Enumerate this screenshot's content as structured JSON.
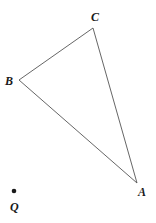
{
  "diagram": {
    "type": "geometry",
    "points": {
      "A": {
        "label": "A",
        "x": 137,
        "y": 183
      },
      "B": {
        "label": "B",
        "x": 19,
        "y": 80
      },
      "C": {
        "label": "C",
        "x": 93,
        "y": 28
      },
      "Q": {
        "label": "Q",
        "x": 14,
        "y": 191
      }
    },
    "triangle": [
      "A",
      "B",
      "C"
    ],
    "stroke_color": "#555555",
    "point_color": "#1a1a1a"
  }
}
